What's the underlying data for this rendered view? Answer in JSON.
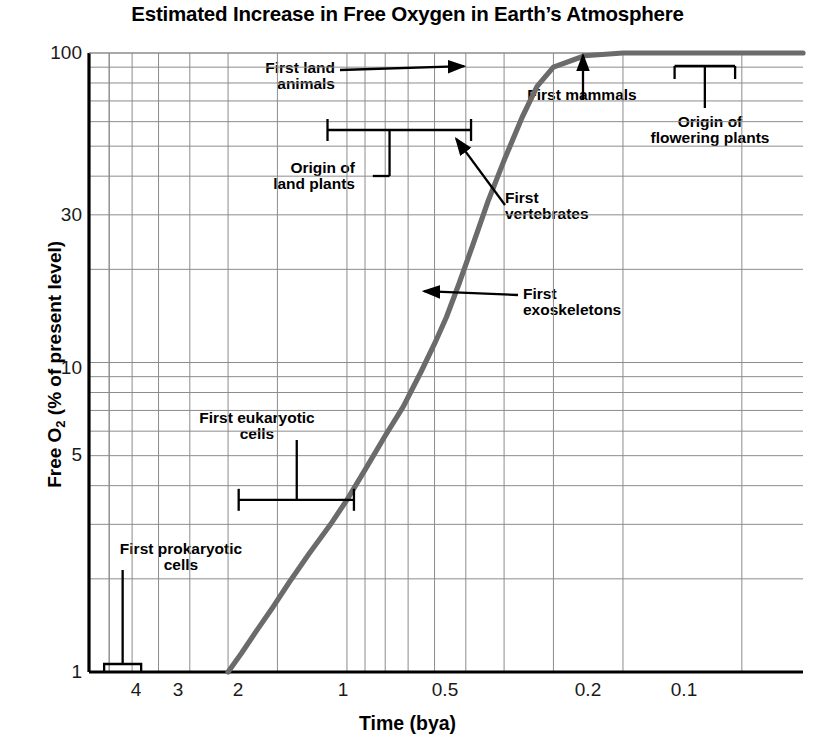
{
  "chart_data": {
    "type": "line",
    "title": "Estimated Increase in Free Oxygen in Earth’s Atmosphere",
    "xlabel": "Time (bya)",
    "ylabel": "Free O2 (% of present level)",
    "ylabel_parts": {
      "prefix": "Free O",
      "sub": "2",
      "suffix": " (% of present level)"
    },
    "xscale": "log-reversed",
    "yscale": "log",
    "xlim": [
      4.5,
      0.07
    ],
    "ylim": [
      1,
      100
    ],
    "grid": true,
    "legend": "none",
    "xticks": [
      "4",
      "3",
      "2",
      "1",
      "0.5",
      "0.2",
      "0.1"
    ],
    "xtick_values": [
      4,
      3,
      2,
      1,
      0.5,
      0.2,
      0.1
    ],
    "yticks": [
      "100",
      "30",
      "10",
      "5",
      "1"
    ],
    "ytick_values": [
      100,
      30,
      10,
      5,
      1
    ],
    "series": [
      {
        "name": "Free O2 (% of present level)",
        "color": "#6b6b6b",
        "x": [
          2.0,
          1.85,
          1.7,
          1.55,
          1.4,
          1.25,
          1.1,
          1.0,
          0.9,
          0.8,
          0.72,
          0.65,
          0.6,
          0.56,
          0.52,
          0.48,
          0.44,
          0.4,
          0.36,
          0.33,
          0.3,
          0.25,
          0.2,
          0.15,
          0.1,
          0.07
        ],
        "y": [
          1.0,
          1.15,
          1.35,
          1.6,
          1.95,
          2.4,
          3.0,
          3.6,
          4.5,
          5.8,
          7.2,
          9.3,
          11.5,
          14.0,
          18.0,
          24.0,
          33.0,
          45.0,
          62.0,
          78.0,
          90.0,
          98.0,
          100.0,
          100.0,
          100.0,
          100.0
        ]
      }
    ],
    "annotations": [
      {
        "id": "first-land-animals",
        "label": "First land\nanimals",
        "line1": "First land",
        "line2": "animals",
        "marker": "arrow",
        "point_x": 0.48,
        "point_y": 95
      },
      {
        "id": "origin-of-land-plants",
        "label": "Origin of\nland plants",
        "line1": "Origin of",
        "line2": "land plants",
        "marker": "range-bracket",
        "range_x": [
          1.1,
          0.47
        ],
        "at_y": 60
      },
      {
        "id": "first-vertebrates",
        "label": "First\nvertebrates",
        "line1": "First",
        "line2": "vertebrates",
        "marker": "arrow",
        "point_x": 0.53,
        "point_y": 55
      },
      {
        "id": "first-exoskeletons",
        "label": "First\nexoskeletons",
        "line1": "First",
        "line2": "exoskeletons",
        "marker": "arrow",
        "point_x": 0.63,
        "point_y": 17
      },
      {
        "id": "first-eukaryotic-cells",
        "label": "First eukaryotic\ncells",
        "line1": "First eukaryotic",
        "line2": "cells",
        "marker": "range-bracket",
        "range_x": [
          1.85,
          0.95
        ],
        "at_y": 3.6
      },
      {
        "id": "first-prokaryotic-cells",
        "label": "First prokaryotic\ncells",
        "line1": "First prokaryotic",
        "line2": "cells",
        "marker": "range-box",
        "range_x": [
          4.1,
          3.3
        ],
        "at_y": 1.0
      },
      {
        "id": "first-mammals",
        "label": "First mammals",
        "line1": "First mammals",
        "line2": "",
        "marker": "arrow",
        "point_x": 0.2,
        "point_y": 100
      },
      {
        "id": "origin-of-flowering-plants",
        "label": "Origin of\nflowering plants",
        "line1": "Origin of",
        "line2": "flowering plants",
        "marker": "range-bracket",
        "range_x": [
          0.145,
          0.105
        ],
        "at_y": 100
      }
    ]
  },
  "colors": {
    "curve": "#6b6b6b",
    "grid": "#8c8c8c",
    "axis": "#000000",
    "text": "#000000"
  }
}
